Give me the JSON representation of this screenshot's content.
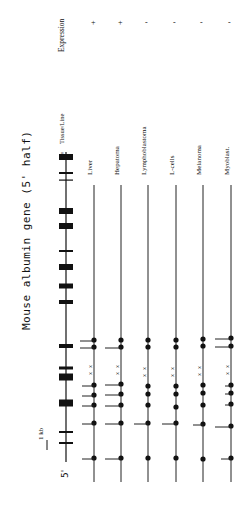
{
  "figure": {
    "title": "Mouse albumin gene (5' half)",
    "scale_label": "1 kb",
    "five_prime": "5'",
    "three_prime": "3'",
    "col_tissue": "Tissue/Line",
    "col_expression": "Expression",
    "exons": [
      {
        "y": 157,
        "w": 14,
        "h": 6
      },
      {
        "y": 173,
        "w": 14,
        "h": 2
      },
      {
        "y": 180,
        "w": 14,
        "h": 1
      },
      {
        "y": 211,
        "w": 14,
        "h": 6
      },
      {
        "y": 226,
        "w": 14,
        "h": 6
      },
      {
        "y": 251,
        "w": 14,
        "h": 2
      },
      {
        "y": 267,
        "w": 14,
        "h": 6
      },
      {
        "y": 286,
        "w": 14,
        "h": 5
      },
      {
        "y": 302,
        "w": 14,
        "h": 4
      },
      {
        "y": 346,
        "w": 14,
        "h": 4
      },
      {
        "y": 368,
        "w": 14,
        "h": 3
      },
      {
        "y": 377,
        "w": 14,
        "h": 7
      },
      {
        "y": 403,
        "w": 14,
        "h": 7
      },
      {
        "y": 432,
        "w": 14,
        "h": 2
      },
      {
        "y": 443,
        "w": 14,
        "h": 2
      }
    ],
    "tissues": [
      {
        "name": "Liver",
        "expression": "+",
        "x": 94,
        "marks": [
          {
            "y": 340,
            "tick": 14
          },
          {
            "y": 347,
            "tick": 14
          },
          {
            "y": 385,
            "tick": 12
          },
          {
            "y": 395,
            "tick": 12
          },
          {
            "y": 405,
            "tick": 12
          },
          {
            "y": 423,
            "tick": 12
          },
          {
            "y": 458,
            "tick": 12
          }
        ],
        "xs": [
          368,
          375
        ]
      },
      {
        "name": "Hepatoma",
        "expression": "+",
        "x": 121,
        "marks": [
          {
            "y": 340,
            "tick": 0
          },
          {
            "y": 347,
            "tick": 16
          },
          {
            "y": 384,
            "tick": 16
          },
          {
            "y": 394,
            "tick": 16
          },
          {
            "y": 405,
            "tick": 16
          },
          {
            "y": 423,
            "tick": 16
          },
          {
            "y": 458,
            "tick": 16
          }
        ],
        "xs": [
          368,
          375
        ]
      },
      {
        "name": "Lymphoblastoma",
        "expression": "-",
        "x": 148,
        "marks": [
          {
            "y": 340,
            "tick": 0
          },
          {
            "y": 347,
            "tick": 0
          },
          {
            "y": 386,
            "tick": 0
          },
          {
            "y": 394,
            "tick": 0
          },
          {
            "y": 405,
            "tick": 0
          },
          {
            "y": 423,
            "tick": 14
          },
          {
            "y": 458,
            "tick": 0
          }
        ],
        "xs": [
          370,
          377
        ]
      },
      {
        "name": "L-cells",
        "expression": "-",
        "x": 176,
        "marks": [
          {
            "y": 340,
            "tick": 0
          },
          {
            "y": 347,
            "tick": 0
          },
          {
            "y": 386,
            "tick": 0
          },
          {
            "y": 394,
            "tick": 0
          },
          {
            "y": 407,
            "tick": 0
          },
          {
            "y": 423,
            "tick": 14
          },
          {
            "y": 458,
            "tick": 0
          }
        ],
        "xs": [
          370,
          377
        ]
      },
      {
        "name": "Melanoma",
        "expression": "-",
        "x": 203,
        "marks": [
          {
            "y": 339,
            "tick": 0
          },
          {
            "y": 346,
            "tick": 0
          },
          {
            "y": 385,
            "tick": 0
          },
          {
            "y": 393,
            "tick": 0
          },
          {
            "y": 405,
            "tick": 0
          },
          {
            "y": 424,
            "tick": 10
          },
          {
            "y": 459,
            "tick": 0
          }
        ],
        "xs": [
          369,
          376
        ]
      },
      {
        "name": "Myoblast.",
        "expression": "-",
        "x": 231,
        "marks": [
          {
            "y": 338,
            "tick": 16
          },
          {
            "y": 346,
            "tick": 16
          },
          {
            "y": 385,
            "tick": 6
          },
          {
            "y": 393,
            "tick": 6
          },
          {
            "y": 404,
            "tick": 6
          },
          {
            "y": 426,
            "tick": 16
          },
          {
            "y": 458,
            "tick": 10
          }
        ],
        "xs": [
          368,
          375
        ]
      }
    ]
  }
}
